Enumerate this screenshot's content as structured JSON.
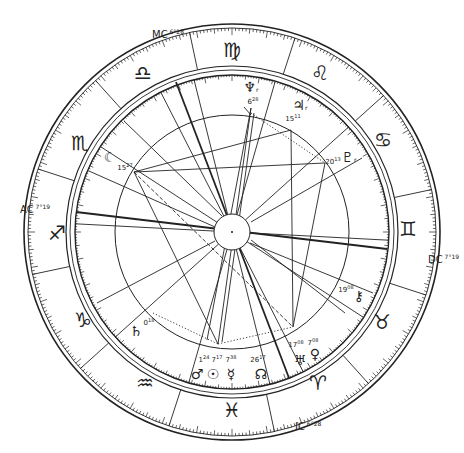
{
  "chart": {
    "center": [
      232,
      232
    ],
    "radii": {
      "outer": 208,
      "outer_inner": 204,
      "sign_inner": 166,
      "degree_ring_outer": 162,
      "degree_ring_inner": 157,
      "aspect_circle": 117,
      "hub": 18
    },
    "stroke_color": "#222222",
    "background": "#ffffff"
  },
  "angles": [
    {
      "name": "MC",
      "label": "MC",
      "degree": "6",
      "minute": "28",
      "x": 152,
      "y": 28
    },
    {
      "name": "AC",
      "label": "AC",
      "degree": "7",
      "minute": "19",
      "x": 20,
      "y": 203
    },
    {
      "name": "DC",
      "label": "DC",
      "degree": "7",
      "minute": "19",
      "x": 428,
      "y": 253
    },
    {
      "name": "IC",
      "label": "IC",
      "degree": "6",
      "minute": "28",
      "x": 295,
      "y": 420
    }
  ],
  "signs": [
    {
      "name": "virgo",
      "glyph": "♍",
      "x": 232,
      "y": 50
    },
    {
      "name": "leo",
      "glyph": "♌",
      "x": 320,
      "y": 73
    },
    {
      "name": "cancer",
      "glyph": "♋",
      "x": 383,
      "y": 140
    },
    {
      "name": "gemini",
      "glyph": "♊",
      "x": 408,
      "y": 229
    },
    {
      "name": "taurus",
      "glyph": "♉",
      "x": 382,
      "y": 322
    },
    {
      "name": "aries",
      "glyph": "♈",
      "x": 318,
      "y": 383
    },
    {
      "name": "pisces",
      "glyph": "♓",
      "x": 232,
      "y": 410
    },
    {
      "name": "aquarius",
      "glyph": "♒",
      "x": 145,
      "y": 383
    },
    {
      "name": "capricorn",
      "glyph": "♑",
      "x": 83,
      "y": 320
    },
    {
      "name": "sagittarius",
      "glyph": "♐",
      "x": 57,
      "y": 233
    },
    {
      "name": "scorpio",
      "glyph": "♏",
      "x": 80,
      "y": 143
    },
    {
      "name": "libra",
      "glyph": "♎",
      "x": 143,
      "y": 73
    }
  ],
  "planets": [
    {
      "name": "neptune",
      "glyph": "♆",
      "retro": "r",
      "degree": "6",
      "minute": "28",
      "gx": 251,
      "gy": 87,
      "dx": 253,
      "dy": 101
    },
    {
      "name": "jupiter",
      "glyph": "♃",
      "retro": "r",
      "degree": "15",
      "minute": "11",
      "gx": 300,
      "gy": 105,
      "dx": 293,
      "dy": 118
    },
    {
      "name": "pluto",
      "glyph": "♇",
      "retro": "r",
      "degree": "20",
      "minute": "13",
      "gx": 349,
      "gy": 157,
      "dx": 333,
      "dy": 161
    },
    {
      "name": "moon",
      "glyph": "☾",
      "retro": "",
      "degree": "15",
      "minute": "27",
      "gx": 110,
      "gy": 157,
      "dx": 125,
      "dy": 167
    },
    {
      "name": "chiron",
      "glyph": "⚷",
      "retro": "",
      "degree": "19",
      "minute": "08",
      "gx": 359,
      "gy": 296,
      "dx": 346,
      "dy": 289
    },
    {
      "name": "uranus",
      "glyph": "♅",
      "retro": "",
      "degree": "17",
      "minute": "08",
      "gx": 300,
      "gy": 360,
      "dx": 296,
      "dy": 344
    },
    {
      "name": "venus",
      "glyph": "♀",
      "retro": "",
      "degree": "7",
      "minute": "08",
      "gx": 315,
      "gy": 354,
      "dx": 313,
      "dy": 342
    },
    {
      "name": "north-node",
      "glyph": "☊",
      "retro": "",
      "degree": "26",
      "minute": "17",
      "gx": 261,
      "gy": 374,
      "dx": 258,
      "dy": 359
    },
    {
      "name": "mercury",
      "glyph": "☿",
      "retro": "",
      "degree": "7",
      "minute": "38",
      "gx": 231,
      "gy": 374,
      "dx": 231,
      "dy": 359
    },
    {
      "name": "sun",
      "glyph": "☉",
      "retro": "",
      "degree": "7",
      "minute": "17",
      "gx": 213,
      "gy": 374,
      "dx": 217,
      "dy": 359
    },
    {
      "name": "mars",
      "glyph": "♂",
      "retro": "",
      "degree": "1",
      "minute": "24",
      "gx": 197,
      "gy": 374,
      "dx": 204,
      "dy": 359
    },
    {
      "name": "saturn",
      "glyph": "♄",
      "retro": "",
      "degree": "0",
      "minute": "18",
      "gx": 136,
      "gy": 331,
      "dx": 149,
      "dy": 322
    }
  ],
  "house_cusps_deg": [
    0,
    30,
    60,
    90,
    120,
    150,
    180,
    210,
    240,
    270,
    300,
    330
  ],
  "house_cusp_angles": [
    183,
    213,
    243,
    256,
    286,
    318,
    3,
    33,
    63,
    76,
    106,
    138
  ],
  "axis_lines": [
    {
      "name": "asc-dsc-axis",
      "x1": 76,
      "y1": 212,
      "x2": 387,
      "y2": 249,
      "weight": 1.8
    },
    {
      "name": "mc-ic-axis",
      "x1": 176,
      "y1": 82,
      "x2": 289,
      "y2": 378,
      "weight": 1.8
    }
  ],
  "aspect_lines": [
    {
      "x1": 134,
      "y1": 172,
      "x2": 291,
      "y2": 130,
      "style": "solid"
    },
    {
      "x1": 134,
      "y1": 172,
      "x2": 325,
      "y2": 163,
      "style": "solid"
    },
    {
      "x1": 134,
      "y1": 172,
      "x2": 218,
      "y2": 344,
      "style": "solid"
    },
    {
      "x1": 134,
      "y1": 172,
      "x2": 293,
      "y2": 327,
      "style": "dashed"
    },
    {
      "x1": 291,
      "y1": 130,
      "x2": 293,
      "y2": 327,
      "style": "solid"
    },
    {
      "x1": 325,
      "y1": 163,
      "x2": 293,
      "y2": 327,
      "style": "solid"
    },
    {
      "x1": 251,
      "y1": 108,
      "x2": 207,
      "y2": 340,
      "style": "solid"
    },
    {
      "x1": 251,
      "y1": 108,
      "x2": 218,
      "y2": 344,
      "style": "solid"
    },
    {
      "x1": 254,
      "y1": 113,
      "x2": 222,
      "y2": 342,
      "style": "solid"
    },
    {
      "x1": 251,
      "y1": 115,
      "x2": 244,
      "y2": 107,
      "style": "solid"
    },
    {
      "x1": 218,
      "y1": 344,
      "x2": 293,
      "y2": 327,
      "style": "dotted"
    },
    {
      "x1": 153,
      "y1": 313,
      "x2": 218,
      "y2": 344,
      "style": "dotted"
    },
    {
      "x1": 251,
      "y1": 113,
      "x2": 325,
      "y2": 163,
      "style": "dotted"
    },
    {
      "x1": 89,
      "y1": 171,
      "x2": 215,
      "y2": 227,
      "style": "solid"
    },
    {
      "x1": 97,
      "y1": 303,
      "x2": 215,
      "y2": 241,
      "style": "solid"
    },
    {
      "x1": 251,
      "y1": 222,
      "x2": 362,
      "y2": 158,
      "style": "solid"
    },
    {
      "x1": 251,
      "y1": 240,
      "x2": 345,
      "y2": 313,
      "style": "solid"
    },
    {
      "x1": 250,
      "y1": 243,
      "x2": 373,
      "y2": 293,
      "style": "solid"
    },
    {
      "x1": 124,
      "y1": 121,
      "x2": 222,
      "y2": 216,
      "style": "solid"
    }
  ],
  "degree_ticks": {
    "per_degree": 1,
    "small_len": 3,
    "five_len": 5,
    "ten_len": 7
  }
}
